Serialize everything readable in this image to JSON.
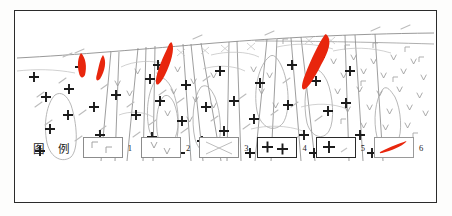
{
  "figure": {
    "type": "geological-cross-section",
    "frame": {
      "x": 14,
      "y": 10,
      "w": 423,
      "h": 193,
      "border_color": "#2b2b2b"
    },
    "background": "#ffffff"
  },
  "legend": {
    "title": "图 例",
    "items": [
      {
        "number": "1",
        "symbol": "corner-bracket-pattern",
        "description": "gamma/corner marks",
        "color": "#9a9a9a"
      },
      {
        "number": "2",
        "symbol": "vee-pattern",
        "description": "v v marks",
        "color": "#9a9a9a"
      },
      {
        "number": "3",
        "symbol": "cross-hatch-pattern",
        "description": "X crossing lines",
        "color": "#b0b0b0"
      },
      {
        "number": "4",
        "symbol": "double-plus-pattern",
        "description": "two bold plus signs",
        "color": "#1d1d1d"
      },
      {
        "number": "5",
        "symbol": "plus-dash-pattern",
        "description": "plus sign with faint dash",
        "color": "#1d1d1d"
      },
      {
        "number": "6",
        "symbol": "red-lens-body",
        "description": "red lenticular ore body",
        "color": "#e8260d"
      }
    ]
  },
  "map": {
    "unit_colors": {
      "outline": "#8d8d8d",
      "thin_outline": "#b4b4b4",
      "dash": "#b9b9b9",
      "plus": "#1b1b1b",
      "vee": "#9c9c9c",
      "corner": "#a2a2a2",
      "red_body": "#e8260d"
    },
    "surface_line": "topographic-surface-contact",
    "ore_bodies": [
      {
        "name": "ore-lens-1",
        "cx": 69,
        "cy": 55
      },
      {
        "name": "ore-lens-2",
        "cx": 85,
        "cy": 58
      },
      {
        "name": "ore-lens-3",
        "cx": 153,
        "cy": 57
      },
      {
        "name": "ore-lens-4",
        "cx": 305,
        "cy": 56
      }
    ]
  }
}
